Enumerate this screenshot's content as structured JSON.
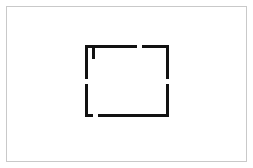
{
  "canvas": {
    "width": 253,
    "height": 168,
    "background_color": "#ffffff",
    "border_color": "#c9c9c9",
    "border_width": 1,
    "border_inset": 6,
    "title": "Floor Plan Sketch"
  },
  "drawing": {
    "name": "room-outline",
    "description": "Rectangular room floor plan with four wall openings and one interior wall stub",
    "stroke_color": "#111111",
    "wall_thickness": 3,
    "fill_color": "none",
    "room": {
      "left": 85,
      "top": 45,
      "right": 169,
      "bottom": 117,
      "width": 84,
      "height": 72
    },
    "walls": [
      {
        "name": "top-wall-left-segment",
        "orientation": "horizontal",
        "x1": 85,
        "y1": 46,
        "x2": 137,
        "y2": 46
      },
      {
        "name": "top-wall-right-segment",
        "orientation": "horizontal",
        "x1": 142,
        "y1": 46,
        "x2": 169,
        "y2": 46
      },
      {
        "name": "left-wall-upper-segment",
        "orientation": "vertical",
        "x1": 86,
        "y1": 45,
        "x2": 86,
        "y2": 79
      },
      {
        "name": "left-wall-lower-segment",
        "orientation": "vertical",
        "x1": 86,
        "y1": 84,
        "x2": 86,
        "y2": 117
      },
      {
        "name": "right-wall-upper-segment",
        "orientation": "vertical",
        "x1": 167,
        "y1": 45,
        "x2": 167,
        "y2": 79
      },
      {
        "name": "right-wall-lower-segment",
        "orientation": "vertical",
        "x1": 167,
        "y1": 84,
        "x2": 167,
        "y2": 117
      },
      {
        "name": "bottom-wall-left-segment",
        "orientation": "horizontal",
        "x1": 85,
        "y1": 115,
        "x2": 93,
        "y2": 115
      },
      {
        "name": "bottom-wall-right-segment",
        "orientation": "horizontal",
        "x1": 98,
        "y1": 115,
        "x2": 169,
        "y2": 115
      },
      {
        "name": "interior-wall-stub",
        "orientation": "vertical",
        "x1": 93,
        "y1": 47,
        "x2": 93,
        "y2": 59
      }
    ],
    "openings": [
      {
        "name": "opening-top",
        "wall": "top",
        "start": 137,
        "end": 142,
        "size": 5
      },
      {
        "name": "opening-left",
        "wall": "left",
        "start": 79,
        "end": 84,
        "size": 5
      },
      {
        "name": "opening-right",
        "wall": "right",
        "start": 79,
        "end": 84,
        "size": 5
      },
      {
        "name": "opening-bottom",
        "wall": "bottom",
        "start": 93,
        "end": 98,
        "size": 5
      }
    ]
  }
}
